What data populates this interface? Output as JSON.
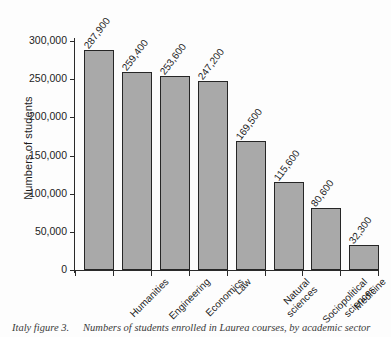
{
  "chart_data": {
    "type": "bar",
    "title": "",
    "xlabel": "",
    "ylabel": "Numbers of students",
    "ylim": [
      0,
      300000
    ],
    "ytick_values": [
      0,
      50000,
      100000,
      150000,
      200000,
      250000,
      300000
    ],
    "ytick_labels": [
      "0",
      "50,000",
      "100,000",
      "150,000",
      "200,000",
      "250,000",
      "300,000"
    ],
    "grid": false,
    "legend": false,
    "bar_color": "#a9a9a9",
    "bar_edge_color": "#262626",
    "categories": [
      "Humanities",
      "Engineering",
      "Economics",
      "Law",
      "Natural sciences",
      "Sociopolitical sciences",
      "Medicine",
      "Agriculture"
    ],
    "category_label_lines": [
      [
        "Humanities"
      ],
      [
        "Engineering"
      ],
      [
        "Economics"
      ],
      [
        "Law"
      ],
      [
        "Natural",
        "sciences"
      ],
      [
        "Sociopolitical",
        "sciences"
      ],
      [
        "Medicine"
      ],
      [
        "Agriculture"
      ]
    ],
    "values": [
      287900,
      259400,
      253600,
      247200,
      169500,
      115600,
      80600,
      32300
    ],
    "value_labels": [
      "287,900",
      "259,400",
      "253,600",
      "247,200",
      "169,500",
      "115,600",
      "80,600",
      "32,300"
    ]
  },
  "caption": {
    "id": "Italy figure 3.",
    "text": "Numbers of students enrolled in Laurea courses, by academic sector"
  }
}
